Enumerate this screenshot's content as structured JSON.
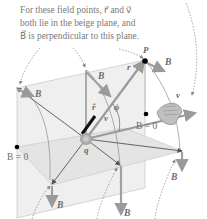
{
  "caption": {
    "line1": "For these field points, r⃗ and v⃗",
    "line2": "both lie in the beige plane, and",
    "line3": "B⃗ is perpendicular to this plane."
  },
  "labels": {
    "point_P": "P",
    "charge_q": "q",
    "vector_r": "r⃗",
    "unit_r_hat": "r̂",
    "vector_v_charge": "v⃗",
    "vector_v_hand": "v⃗",
    "angle_phi": "ϕ",
    "B_zero_right": "B = 0",
    "B_zero_left": "B = 0",
    "B_vector": "B⃗"
  },
  "colors": {
    "plane_fill": "#e9e9e9",
    "vector_gray": "#9a9a9a",
    "dark_line": "#555555",
    "text": "#6b6b6b",
    "dotted_field_line": "#8a8a8a"
  },
  "icons": {
    "right_hand": "right-hand-rule-icon"
  }
}
